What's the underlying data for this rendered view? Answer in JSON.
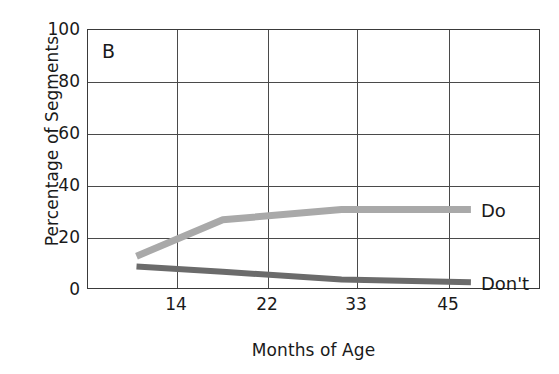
{
  "chart_data": {
    "type": "line",
    "title": "",
    "panel_label": "B",
    "xlabel": "Months of Age",
    "ylabel": "Percentage of Segments",
    "x": [
      14,
      22,
      33,
      45
    ],
    "xtick_labels": [
      "14",
      "22",
      "33",
      "45"
    ],
    "ytick_labels": [
      "0",
      "20",
      "40",
      "60",
      "80",
      "100"
    ],
    "yticks": [
      0,
      20,
      40,
      60,
      80,
      100
    ],
    "ylim": [
      0,
      100
    ],
    "xlim": [
      9.5,
      51.5
    ],
    "grid": true,
    "legend_position": "right-inline",
    "series": [
      {
        "name": "Do",
        "label": "Do",
        "color": "#a9a9a9",
        "values": [
          13,
          27,
          31,
          31
        ]
      },
      {
        "name": "Don't",
        "label": "Don't",
        "color": "#6b6b6b",
        "values": [
          9,
          7,
          4,
          3
        ]
      }
    ]
  },
  "colors": {
    "frame": "#3a3a3a",
    "grid": "#4a4a4a",
    "background": "#ffffff",
    "text": "#1a1a1a"
  }
}
